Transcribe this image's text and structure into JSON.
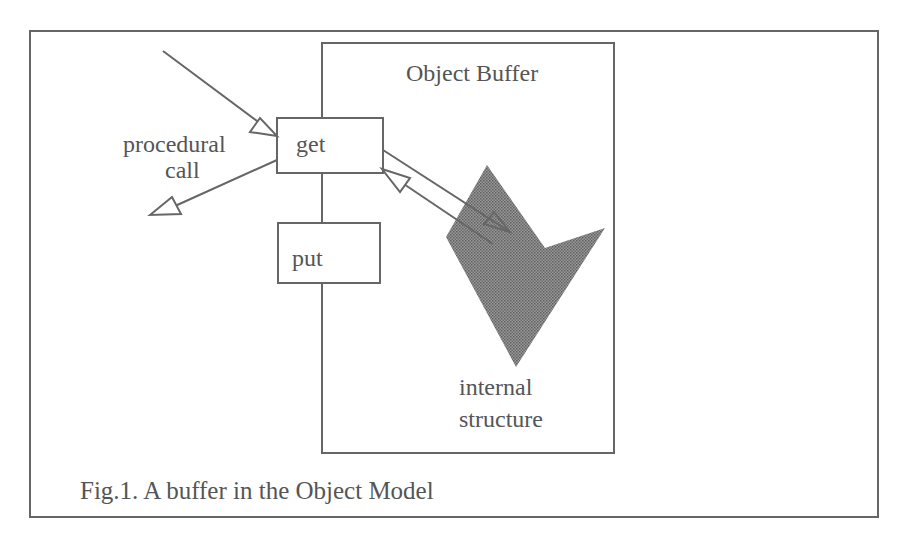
{
  "figure": {
    "caption": "Fig.1. A buffer in the Object Model",
    "colors": {
      "stroke": "#666666",
      "text": "#555555",
      "shape_fill": "#7a7a7a",
      "background": "#ffffff"
    }
  },
  "diagram": {
    "container": {
      "label": "Object Buffer"
    },
    "boxes": [
      {
        "id": "get",
        "label": "get"
      },
      {
        "id": "put",
        "label": "put"
      }
    ],
    "labels": {
      "procedural_line1": "procedural",
      "procedural_line2": "call",
      "internal_line1": "internal",
      "internal_line2": "structure"
    },
    "edges": [
      {
        "from": "outside",
        "to": "get",
        "label": "procedural call (incoming)"
      },
      {
        "from": "get",
        "to": "outside",
        "label": "procedural call (return)"
      },
      {
        "from": "get",
        "to": "internal structure"
      },
      {
        "from": "internal structure",
        "to": "get"
      }
    ]
  }
}
